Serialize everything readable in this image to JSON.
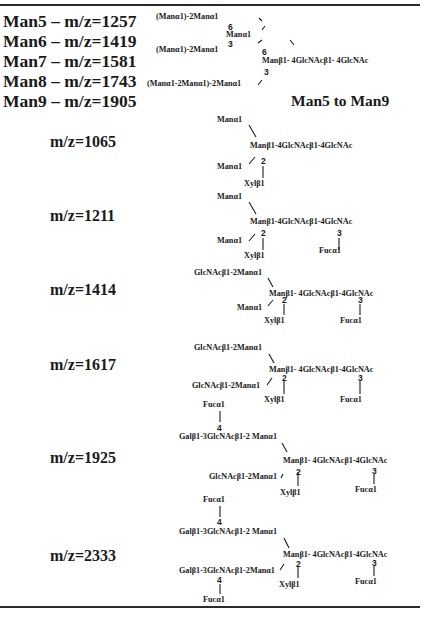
{
  "header_rows": [
    {
      "label": "Man5 – m/z=1257"
    },
    {
      "label": "Man6 – m/z=1419"
    },
    {
      "label": "Man7 – m/z=1581"
    },
    {
      "label": "Man8 – m/z=1743"
    },
    {
      "label": "Man9 – m/z=1905"
    }
  ],
  "mannose_structure": {
    "caption": "Man5 to Man9",
    "branch_top": "(Manα1)-2Manα1",
    "branch_mid": "(Manα1)-2Manα1",
    "branch_bottom": "(Manα1-2Manα1)-2Manα1",
    "mid_node": "Manα1",
    "core": "Manβ1- 4GlcNAcβ1- 4GlcNAc",
    "link_6a": "6",
    "link_3a": "3",
    "link_6b": "6",
    "link_3b": "3"
  },
  "rows": [
    {
      "mz": "m/z=1065",
      "upper": "Manα1",
      "core": "Manβ1-4GlcNAcβ1-4GlcNAc",
      "lower": "Manα1",
      "xyl_link": "2",
      "xyl": "Xylβ1"
    },
    {
      "mz": "m/z=1211",
      "upper": "Manα1",
      "core": "Manβ1-4GlcNAcβ1-4GlcNAc",
      "lower": "Manα1",
      "xyl_link": "2",
      "xyl": "Xylβ1",
      "fuc_link": "3",
      "fuc": "Fucα1"
    },
    {
      "mz": "m/z=1414",
      "upper": "GlcNAcβ1-2Manα1",
      "core": "Manβ1- 4GlcNAcβ1-4GlcNAc",
      "lower": "Manα1",
      "xyl_link": "2",
      "xyl": "Xylβ1",
      "fuc_link": "3",
      "fuc": "Fucα1"
    },
    {
      "mz": "m/z=1617",
      "upper": "GlcNAcβ1-2Manα1",
      "core": "Manβ1- 4GlcNAcβ1-4GlcNAc",
      "lower": "GlcNAcβ1-2Manα1",
      "xyl_link": "2",
      "xyl": "Xylβ1",
      "fuc_link": "3",
      "fuc": "Fucα1"
    },
    {
      "mz": "m/z=1925",
      "upper_fuc": "Fucα1",
      "upper_fuc_link": "4",
      "upper": "Galβ1-3GlcNAcβ1-2 Manα1",
      "core": "Manβ1- 4GlcNAcβ1-4GlcNAc",
      "lower": "GlcNAcβ1-2Manα1",
      "xyl_link": "2",
      "xyl": "Xylβ1",
      "fuc_link": "3",
      "fuc": "Fucα1"
    },
    {
      "mz": "m/z=2333",
      "upper_fuc": "Fucα1",
      "upper_fuc_link": "4",
      "upper": "Galβ1-3GlcNAcβ1-2 Manα1",
      "core": "Manβ1- 4GlcNAcβ1-4GlcNAc",
      "lower": "Galβ1-3GlcNAcβ1-2Manα1",
      "lower_fuc_link": "4",
      "lower_fuc": "Fucα1",
      "xyl_link": "2",
      "xyl": "Xylβ1",
      "fuc_link": "3",
      "fuc": "Fucα1"
    }
  ]
}
